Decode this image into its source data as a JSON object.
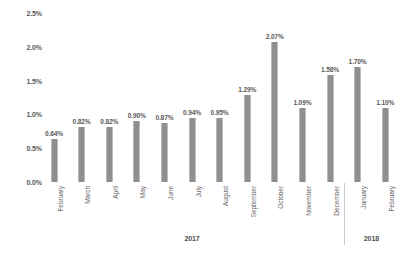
{
  "chart_data": {
    "type": "bar",
    "title": "",
    "subtitle": "",
    "xlabel": "",
    "ylabel": "",
    "ylim": [
      0,
      2.5
    ],
    "grid": false,
    "legend": "none",
    "y_ticks": [
      "0.0%",
      "0.5%",
      "1.0%",
      "1.5%",
      "2.0%",
      "2.5%"
    ],
    "y_tick_values": [
      0.0,
      0.5,
      1.0,
      1.5,
      2.0,
      2.5
    ],
    "categories": [
      "February",
      "March",
      "April",
      "May",
      "June",
      "July",
      "August",
      "September",
      "October",
      "November",
      "December",
      "January",
      "February"
    ],
    "values": [
      0.64,
      0.82,
      0.82,
      0.9,
      0.87,
      0.94,
      0.95,
      1.29,
      2.07,
      1.09,
      1.58,
      1.7,
      1.1
    ],
    "data_labels": [
      "0.64%",
      "0.82%",
      "0.82%",
      "0.90%",
      "0.87%",
      "0.94%",
      "0.95%",
      "1.29%",
      "2.07%",
      "1.09%",
      "1.58%",
      "1.70%",
      "1.10%"
    ],
    "group_labels": [
      "2017",
      "2018"
    ],
    "groups": [
      {
        "label": "2017",
        "categories": [
          "February",
          "March",
          "April",
          "May",
          "June",
          "July",
          "August",
          "September",
          "October",
          "November",
          "December"
        ]
      },
      {
        "label": "2018",
        "categories": [
          "January",
          "February"
        ]
      }
    ],
    "bar_color": "#8f8f8f",
    "label_color": "#5b5b5b",
    "background_color": "#ffffff"
  }
}
